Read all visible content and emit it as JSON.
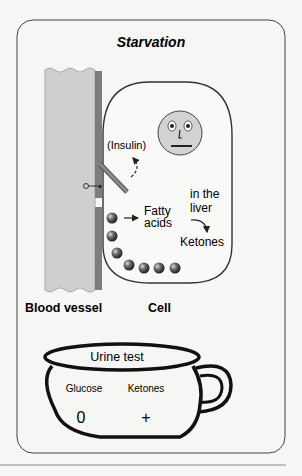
{
  "title": "Starvation",
  "labels": {
    "insulin": "(Insulin)",
    "fatty_line1": "Fatty",
    "fatty_line2": "acids",
    "liver_line1": "in the",
    "liver_line2": "liver",
    "ketones": "Ketones",
    "blood_vessel": "Blood vessel",
    "cell": "Cell"
  },
  "urine_test": {
    "title": "Urine test",
    "columns": [
      {
        "name": "Glucose",
        "value": "0"
      },
      {
        "name": "Ketones",
        "value": "+"
      }
    ]
  },
  "colors": {
    "background": "#f6f6f4",
    "vessel": "#cfcfcf",
    "vessel_wall": "#7d7d7d",
    "face": "#d2d2d2",
    "outline": "#333333"
  }
}
